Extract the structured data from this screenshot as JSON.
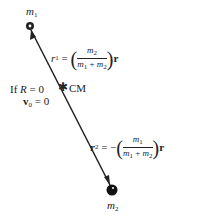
{
  "diagram": {
    "mass1": {
      "label": "m",
      "sub": "1"
    },
    "mass2": {
      "label": "m",
      "sub": "2"
    },
    "cm_label": "CM",
    "condition": {
      "line1": {
        "prefix": "If ",
        "var": "R",
        "rest": " = 0"
      },
      "line2": {
        "var": "v",
        "sub": "0",
        "rest": " = 0"
      }
    },
    "r1": {
      "lhs": "r",
      "lhs_sub": "1",
      "eq": " = ",
      "num": {
        "v": "m",
        "s": "2"
      },
      "den": {
        "a": "m",
        "as": "1",
        "op": " + ",
        "b": "m",
        "bs": "2"
      },
      "tail": "r"
    },
    "r2": {
      "lhs": "r",
      "lhs_sub": "2",
      "eq": " = −",
      "num": {
        "v": "m",
        "s": "1"
      },
      "den": {
        "a": "m",
        "as": "1",
        "op": " + ",
        "b": "m",
        "bs": "2"
      },
      "tail": "r"
    },
    "colors": {
      "ink": "#222222",
      "background": "#ffffff"
    }
  }
}
